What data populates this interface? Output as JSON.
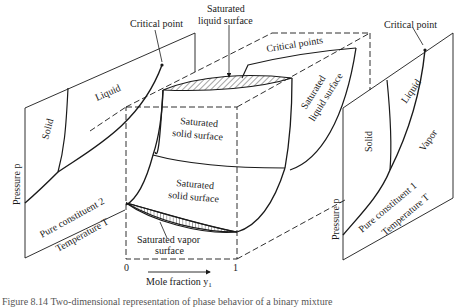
{
  "figure": {
    "caption_partial": "Figure 8.14  Two-dimensional representation of phase behavior of a binary mixture"
  },
  "left_plane": {
    "critical_point_label": "Critical point",
    "region_solid": "Solid",
    "region_liquid": "Liquid",
    "axis_pressure": "Pressure p",
    "constituent_label": "Pure constituent 2",
    "axis_temperature": "Temperature T"
  },
  "center_block": {
    "saturated_liquid_surface_top": "Saturated\nliquid surface",
    "saturated_liquid_surface_top_line1": "Saturated",
    "saturated_liquid_surface_top_line2": "liquid surface",
    "critical_points_label": "Critical points",
    "saturated_liquid_surface_side_line1": "Saturated",
    "saturated_liquid_surface_side_line2": "liquid surface",
    "saturated_solid_surface_upper_line1": "Saturated",
    "saturated_solid_surface_upper_line2": "solid surface",
    "saturated_solid_surface_lower_line1": "Saturated",
    "saturated_solid_surface_lower_line2": "solid surface",
    "saturated_vapor_surface_line1": "Saturated vapor",
    "saturated_vapor_surface_line2": "surface",
    "axis_min": "0",
    "axis_max": "1",
    "axis_label": "Mole fraction y",
    "axis_label_subscript": "1"
  },
  "right_plane": {
    "critical_point_label": "Critical point",
    "region_solid": "Solid",
    "region_liquid": "Liquid",
    "region_vapor": "Vapor",
    "axis_pressure": "Pressure p",
    "constituent_label": "Pure constituent 1",
    "axis_temperature": "Temperature T"
  },
  "colors": {
    "line": "#1a1a1a",
    "background": "#ffffff"
  }
}
